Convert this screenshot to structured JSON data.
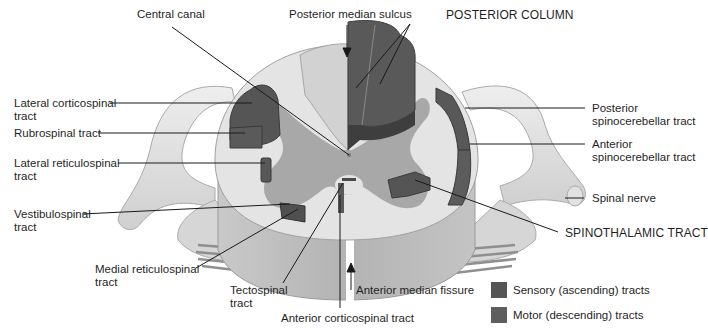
{
  "diagram": {
    "colors": {
      "sensory": "#555555",
      "motor": "#5e5e5e",
      "white_matter": "#e6e6e6",
      "gray_matter": "#a9a9a9",
      "cord_side": "#b9b9b9",
      "nerve": "#d9d9d9",
      "line": "#1a1a1a"
    },
    "labels": {
      "central_canal": "Central canal",
      "posterior_median_sulcus": "Posterior median sulcus",
      "posterior_column": "POSTERIOR COLUMN",
      "lateral_corticospinal": "Lateral corticospinal",
      "lateral_corticospinal_2": "tract",
      "rubrospinal": "Rubrospinal tract",
      "lateral_reticulospinal": "Lateral reticulospinal",
      "lateral_reticulospinal_2": "tract",
      "vestibulospinal": "Vestibulospinal",
      "vestibulospinal_2": "tract",
      "medial_reticulospinal": "Medial reticulospinal",
      "medial_reticulospinal_2": "tract",
      "tectospinal": "Tectospinal",
      "tectospinal_2": "tract",
      "anterior_corticospinal": "Anterior corticospinal tract",
      "anterior_median_fissure": "Anterior median fissure",
      "posterior_spinocerebellar": "Posterior",
      "posterior_spinocerebellar_2": "spinocerebellar tract",
      "anterior_spinocerebellar": "Anterior",
      "anterior_spinocerebellar_2": "spinocerebellar tract",
      "spinal_nerve": "Spinal nerve",
      "spinothalamic": "SPINOTHALAMIC TRACT"
    },
    "legend": [
      {
        "label": "Sensory (ascending) tracts",
        "color": "#555555"
      },
      {
        "label": "Motor (descending) tracts",
        "color": "#5e5e5e"
      }
    ]
  }
}
